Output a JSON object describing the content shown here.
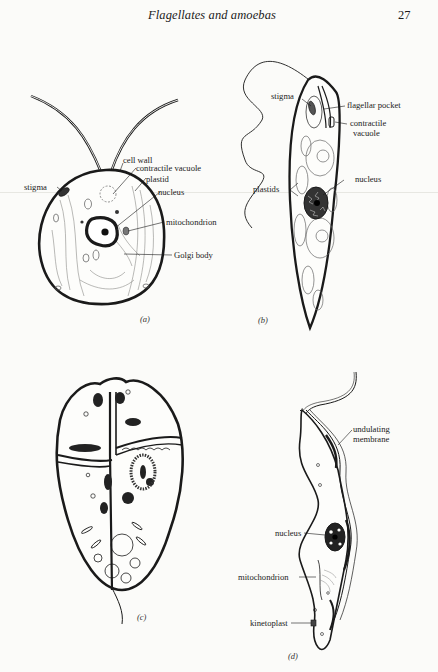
{
  "header": {
    "running_head": "Flagellates and amoebas",
    "page_number": "27"
  },
  "figures": [
    {
      "id": "a",
      "caption": "(a)",
      "labels": {
        "cell_wall": "cell wall",
        "contractile_vacuole": "contractile vacuole",
        "plastid": "plastid",
        "nucleus": "nucleus",
        "mitochondrion": "mitochondrion",
        "golgi_body": "Golgi body",
        "stigma": "stigma"
      }
    },
    {
      "id": "b",
      "caption": "(b)",
      "labels": {
        "stigma": "stigma",
        "flagellar_pocket": "flagellar pocket",
        "contractile_vacuole_1": "contractile",
        "contractile_vacuole_2": "vacuole",
        "plastids": "plastids",
        "nucleus": "nucleus"
      }
    },
    {
      "id": "c",
      "caption": "(c)",
      "labels": {}
    },
    {
      "id": "d",
      "caption": "(d)",
      "labels": {
        "undulating_membrane_1": "undulating",
        "undulating_membrane_2": "membrane",
        "nucleus": "nucleus",
        "mitochondrion": "mitochondrion",
        "kinetoplast": "kinetoplast"
      }
    }
  ]
}
